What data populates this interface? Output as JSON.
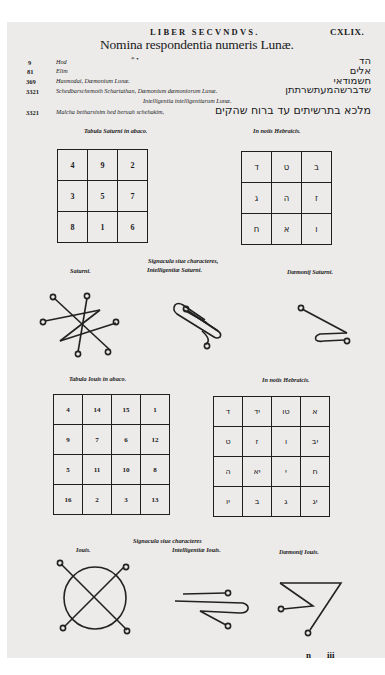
{
  "header": {
    "running_head": "LIBER SECVNDVS.",
    "folio": "CXLIX.",
    "title": "Nomina respondentia numeris Lunæ.",
    "marks": "* •"
  },
  "names": [
    {
      "number": "9",
      "latin": "Hod",
      "hebrew": "הד"
    },
    {
      "number": "81",
      "latin": "Elim",
      "hebrew": "אלים"
    },
    {
      "number": "369",
      "latin": "Hasmodai, Dæmonium Lunæ.",
      "hebrew": "חשמודאי"
    },
    {
      "number": "3321",
      "latin": "Schedbarschemoth Schartathan, Dæmonium dæmoniorum Lunæ.",
      "hebrew": "שדברשהמעתשרתתן"
    },
    {
      "number": "",
      "latin": "Intelligentia intelligentiarum Lunæ.",
      "hebrew": ""
    },
    {
      "number": "3321",
      "latin": "Malcha betharsisim hed beruah schehakim,",
      "hebrew": "מלכא בתרשיתים עד ברוח שהקים"
    }
  ],
  "saturn": {
    "table_caption": "Tabula Saturni in abaco.",
    "hebrew_caption": "In notis Hebraicis.",
    "abacus": [
      [
        "4",
        "9",
        "2"
      ],
      [
        "3",
        "5",
        "7"
      ],
      [
        "8",
        "1",
        "6"
      ]
    ],
    "hebrew_grid": [
      [
        "ד",
        "ט",
        "ב"
      ],
      [
        "ג",
        "ה",
        "ז"
      ],
      [
        "ח",
        "א",
        "ו"
      ]
    ],
    "seals_caption_line1": "Signacula siue characteres,",
    "seals_caption_line2": "Intelligentiæ Saturni.",
    "seal_left_label": "Saturni.",
    "seal_right_label": "Dæmonij Saturni."
  },
  "jupiter": {
    "table_caption": "Tabula Iouis in abaco.",
    "hebrew_caption": "In notis Hebraicis.",
    "abacus": [
      [
        "4",
        "14",
        "15",
        "1"
      ],
      [
        "9",
        "7",
        "6",
        "12"
      ],
      [
        "5",
        "11",
        "10",
        "8"
      ],
      [
        "16",
        "2",
        "3",
        "13"
      ]
    ],
    "hebrew_grid": [
      [
        "ד",
        "יד",
        "טו",
        "א"
      ],
      [
        "ט",
        "ז",
        "ו",
        "יב"
      ],
      [
        "ה",
        "יא",
        "י",
        "ח"
      ],
      [
        "יו",
        "ב",
        "ג",
        "יג"
      ]
    ],
    "seals_caption_line1": "Signacula siue characteres",
    "seals_caption_line2": "Intelligentiæ Iouis.",
    "seal_left_label": "Iouis.",
    "seal_right_label": "Dæmonij Iouis."
  },
  "signature": {
    "letter": "n",
    "number": "iii"
  }
}
